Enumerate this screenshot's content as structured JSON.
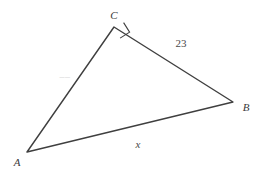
{
  "figure": {
    "type": "right-triangle-diagram",
    "background_color": "#ffffff",
    "line_color": "#3f3f3f",
    "label_color": "#3a3a3a",
    "vertices": [
      {
        "name": "A",
        "label": "A",
        "x": 27,
        "y": 152,
        "label_x": 17,
        "label_y": 166
      },
      {
        "name": "B",
        "label": "B",
        "x": 233,
        "y": 102,
        "label_x": 243,
        "label_y": 111
      },
      {
        "name": "C",
        "label": "C",
        "x": 114,
        "y": 27,
        "label_x": 110,
        "label_y": 19
      }
    ],
    "right_angle": {
      "at_vertex": "C",
      "marker": "square",
      "present": true
    },
    "sides": [
      {
        "name": "side-cb",
        "from": "C",
        "to": "B",
        "label": "23",
        "label_x": 181,
        "label_y": 47,
        "style": "number"
      },
      {
        "name": "side-ac",
        "from": "A",
        "to": "C",
        "label": "––",
        "label_x": 65,
        "label_y": 80,
        "style": "faint-illegible"
      },
      {
        "name": "side-ab",
        "from": "A",
        "to": "B",
        "label": "x",
        "label_x": 138,
        "label_y": 148,
        "style": "variable"
      }
    ]
  }
}
